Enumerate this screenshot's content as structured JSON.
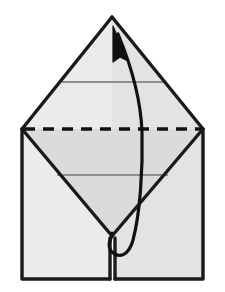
{
  "figure": {
    "title": "Origami fold diagram",
    "canvas": {
      "width": 225,
      "height": 292,
      "background": "#ffffff"
    }
  },
  "colors": {
    "paper_light": "#eceaea",
    "paper_mid": "#e3e1e1",
    "paper_shade": "#d9d7d7",
    "outline": "#1a1a1a",
    "crease_gray": "#8f8f8f",
    "fold_dash": "#111111",
    "arrow": "#111111",
    "background": "#ffffff"
  },
  "geometry": {
    "apex": {
      "x": 112,
      "y": 17
    },
    "left_vertex": {
      "x": 22,
      "y": 129
    },
    "right_vertex": {
      "x": 203,
      "y": 129
    },
    "v_point": {
      "x": 112,
      "y": 236
    },
    "bottom_left": {
      "x": 22,
      "y": 279
    },
    "bottom_right": {
      "x": 203,
      "y": 279
    },
    "slit_x": 112,
    "slit_top_y": 236,
    "slit_bottom_y": 279
  },
  "creases": {
    "upper_gray_line": {
      "y": 82,
      "x1": 62,
      "x2": 163,
      "color": "#8f8f8f",
      "label": "upper-crease"
    },
    "lower_gray_line": {
      "y": 175,
      "x1": 57,
      "x2": 168,
      "color": "#8f8f8f",
      "label": "lower-crease"
    },
    "dashed_fold_line": {
      "y": 129,
      "x1": 22,
      "x2": 203,
      "dash_pattern": "11 8",
      "stroke_width": 3.4,
      "label": "valley-fold-line",
      "style": "dashed"
    }
  },
  "arrow": {
    "label": "fold-direction-arrow",
    "description": "Curved arrow looping from the lower middle of the model up to the top apex",
    "tip": {
      "x": 116,
      "y": 29
    },
    "loop_bottom": {
      "x": 126,
      "y": 254
    },
    "stroke_width": 3.2
  },
  "panels": [
    {
      "name": "top-left-triangle-panel",
      "fill": "#eceaea"
    },
    {
      "name": "top-right-triangle-panel",
      "fill": "#e3e1e1"
    },
    {
      "name": "left-body-panel",
      "fill": "#eceaea"
    },
    {
      "name": "right-body-panel",
      "fill": "#e3e1e1"
    },
    {
      "name": "centre-flap-panel",
      "fill": "#d9d7d7"
    }
  ]
}
